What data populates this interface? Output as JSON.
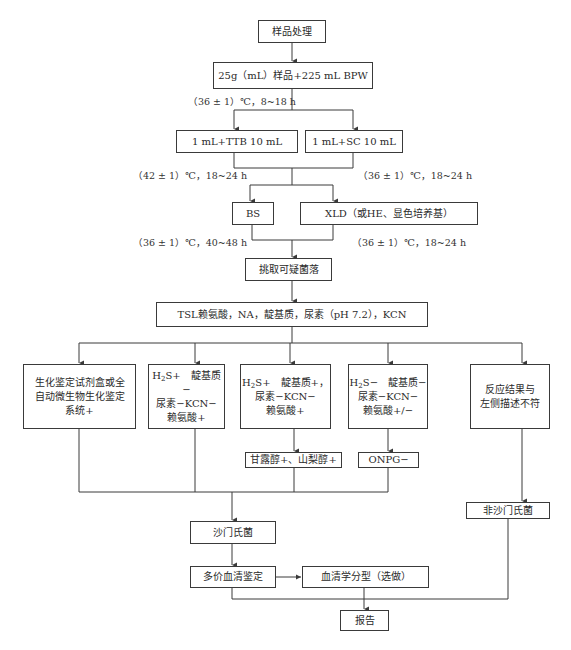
{
  "flowchart": {
    "nodes": {
      "sample_processing": "样品处理",
      "pre_enrichment": "25g（mL）样品+225 mL BPW",
      "ttb": "1 mL+TTB 10 mL",
      "sc": "1 mL+SC 10 mL",
      "bs": "BS",
      "xld": "XLD（或HE、显色培养基）",
      "pick_colonies": "挑取可疑菌落",
      "screening": "TSL赖氨酸，NA，靛基质，尿素（pH 7.2），KCN",
      "result_1": [
        "生化鉴定试剂盒或全",
        "自动微生物生化鉴定",
        "系统+"
      ],
      "result_2": {
        "h2s": "H",
        "h2s_sub": "2",
        "h2s_tail": "S+",
        "l1_rest": "　靛基质−",
        "l2": "尿素−KCN−",
        "l3": "赖氨酸+"
      },
      "result_3": {
        "h2s": "H",
        "h2s_sub": "2",
        "h2s_tail": "S+",
        "l1_rest": "　靛基质+，",
        "l2": "尿素−KCN−",
        "l3": "赖氨酸+"
      },
      "result_4": {
        "h2s": "H",
        "h2s_sub": "2",
        "h2s_tail": "S−",
        "l1_rest": "　靛基质−",
        "l2": "尿素−KCN−",
        "l3": "赖氨酸+/−"
      },
      "result_5": [
        "反应结果与",
        "左侧描述不符"
      ],
      "sugar_test": "甘露醇+、山梨醇+",
      "onpg": "ONPG−",
      "salmonella": "沙门氏菌",
      "non_salmonella": "非沙门氏菌",
      "polyvalent_serum": "多价血清鉴定",
      "serotyping": "血清学分型（选做）",
      "report": "报告"
    },
    "conditions": {
      "pre_enrich": "（36 ± 1）℃，8~18 h",
      "ttb_incubate": "（42 ± 1）℃，18~24 h",
      "sc_incubate": "（36 ± 1）℃，18~24 h",
      "bs_incubate": "（36 ± 1）℃，40~48 h",
      "xld_incubate": "（36 ± 1）℃，18~24 h"
    },
    "colors": {
      "line": "#3a3a3a",
      "text": "#2a2a2a",
      "background": "#ffffff"
    }
  }
}
